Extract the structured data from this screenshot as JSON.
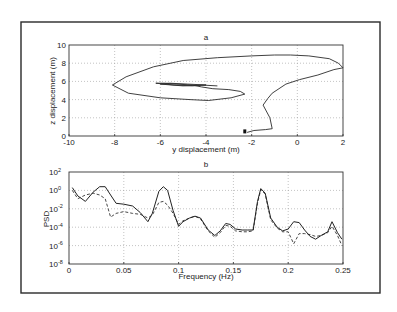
{
  "chart_data": [
    {
      "type": "line",
      "panel": "a",
      "title": "a",
      "xlabel": "y displacement (m)",
      "ylabel": "z displacement (m)",
      "xlim": [
        -10,
        2
      ],
      "ylim": [
        0,
        10
      ],
      "xticks": [
        "-10",
        "-8",
        "-6",
        "-4",
        "-2",
        "0",
        "2"
      ],
      "yticks": [
        "0",
        "2",
        "4",
        "6",
        "8",
        "10"
      ],
      "grid": true,
      "series": [
        {
          "name": "trajectory",
          "style": "solid",
          "x": [
            -2.2,
            -1.9,
            -1.4,
            -1.1,
            -1.2,
            -1.5,
            -1.3,
            -1.1,
            -0.5,
            0.1,
            0.9,
            1.6,
            2.0,
            1.8,
            1.4,
            0.5,
            -0.3,
            -1.0,
            -2.0,
            -3.5,
            -5.0,
            -6.3,
            -7.5,
            -8.1,
            -7.4,
            -6.0,
            -4.7,
            -3.9,
            -2.9,
            -2.3,
            -2.5,
            -3.0,
            -3.7,
            -4.2,
            -4.6,
            -5.3,
            -5.8,
            -6.2,
            -5.4,
            -4.6,
            -4.0,
            -4.8,
            -5.6,
            -6.0,
            -5.0,
            -4.2,
            -3.5
          ],
          "y": [
            0.4,
            0.6,
            0.7,
            0.8,
            2.0,
            3.4,
            4.1,
            4.7,
            5.7,
            6.2,
            6.7,
            7.3,
            7.5,
            8.0,
            8.5,
            8.8,
            8.9,
            8.9,
            8.8,
            8.6,
            8.3,
            7.6,
            6.5,
            5.6,
            4.7,
            4.2,
            4.0,
            3.9,
            4.2,
            4.6,
            4.9,
            5.1,
            5.2,
            5.4,
            5.6,
            5.7,
            5.8,
            5.8,
            5.6,
            5.5,
            5.6,
            5.7,
            5.8,
            5.7,
            5.5,
            5.6,
            5.5
          ]
        }
      ],
      "annotations": [
        {
          "type": "marker",
          "x": -2.3,
          "y": 0.4
        }
      ]
    },
    {
      "type": "line",
      "panel": "b",
      "title": "b",
      "xlabel": "Frequency (Hz)",
      "ylabel": "PSD",
      "xlim": [
        0,
        0.25
      ],
      "ylim_log10": [
        -8,
        2
      ],
      "yscale": "log",
      "xticks": [
        "0",
        "0.05",
        "0.1",
        "0.15",
        "0.2",
        "0.25"
      ],
      "yticks": [
        "10^2",
        "10^0",
        "10^-2",
        "10^-4",
        "10^-6",
        "10^-8"
      ],
      "grid": true,
      "series": [
        {
          "name": "solid",
          "style": "solid",
          "x": [
            0.003,
            0.008,
            0.015,
            0.022,
            0.028,
            0.033,
            0.038,
            0.043,
            0.05,
            0.058,
            0.065,
            0.072,
            0.076,
            0.082,
            0.086,
            0.09,
            0.095,
            0.1,
            0.104,
            0.11,
            0.115,
            0.12,
            0.127,
            0.133,
            0.138,
            0.143,
            0.147,
            0.152,
            0.158,
            0.163,
            0.168,
            0.172,
            0.175,
            0.179,
            0.184,
            0.19,
            0.195,
            0.2,
            0.205,
            0.21,
            0.215,
            0.22,
            0.225,
            0.23,
            0.236,
            0.24,
            0.245,
            0.249
          ],
          "log10_y": [
            0.3,
            -0.6,
            -1.2,
            -0.2,
            0.4,
            0.4,
            -0.5,
            -1.4,
            -1.5,
            -1.7,
            -2.4,
            -3.4,
            -2.5,
            -0.1,
            0.4,
            0.0,
            -2.2,
            -3.9,
            -3.4,
            -3.0,
            -2.8,
            -3.0,
            -4.3,
            -4.9,
            -4.4,
            -3.6,
            -3.7,
            -4.2,
            -4.3,
            -4.3,
            -4.3,
            -1.2,
            0.2,
            -0.3,
            -3.0,
            -4.0,
            -4.4,
            -4.2,
            -3.4,
            -3.5,
            -4.3,
            -5.0,
            -5.3,
            -4.9,
            -4.5,
            -3.4,
            -4.6,
            -5.3
          ]
        },
        {
          "name": "dashed",
          "style": "dashed",
          "x": [
            0.003,
            0.008,
            0.015,
            0.022,
            0.028,
            0.033,
            0.038,
            0.043,
            0.05,
            0.058,
            0.065,
            0.072,
            0.076,
            0.082,
            0.086,
            0.09,
            0.095,
            0.1,
            0.104,
            0.11,
            0.115,
            0.12,
            0.127,
            0.133,
            0.138,
            0.143,
            0.147,
            0.152,
            0.158,
            0.163,
            0.168,
            0.172,
            0.175,
            0.179,
            0.184,
            0.19,
            0.195,
            0.2,
            0.205,
            0.21,
            0.215,
            0.22,
            0.225,
            0.23,
            0.236,
            0.24,
            0.245,
            0.249
          ],
          "log10_y": [
            0.0,
            -0.9,
            -0.5,
            -0.3,
            -0.5,
            -0.9,
            -2.9,
            -2.5,
            -2.3,
            -2.5,
            -2.6,
            -3.0,
            -2.7,
            -1.3,
            -1.2,
            -1.6,
            -2.5,
            -3.7,
            -3.3,
            -3.0,
            -2.8,
            -3.1,
            -4.4,
            -5.1,
            -4.6,
            -3.8,
            -3.9,
            -4.4,
            -4.5,
            -4.5,
            -4.4,
            -1.4,
            0.1,
            -0.4,
            -3.2,
            -4.1,
            -4.5,
            -4.5,
            -5.8,
            -4.7,
            -4.7,
            -4.8,
            -5.0,
            -4.9,
            -4.6,
            -3.9,
            -4.9,
            -6.0
          ]
        }
      ]
    }
  ],
  "figure": {
    "panel_a": {
      "title": "a",
      "xlabel": "y displacement (m)",
      "ylabel": "z displacement (m)",
      "xticks": [
        "-10",
        "-8",
        "-6",
        "-4",
        "-2",
        "0",
        "2"
      ],
      "yticks": [
        "0",
        "2",
        "4",
        "6",
        "8",
        "10"
      ]
    },
    "panel_b": {
      "title": "b",
      "xlabel": "Frequency (Hz)",
      "ylabel": "PSD",
      "xticks": [
        "0",
        "0.05",
        "0.1",
        "0.15",
        "0.2",
        "0.25"
      ],
      "ytick_exponents": [
        "2",
        "0",
        "-2",
        "-4",
        "-6",
        "-8"
      ],
      "ytick_base": "10"
    }
  }
}
